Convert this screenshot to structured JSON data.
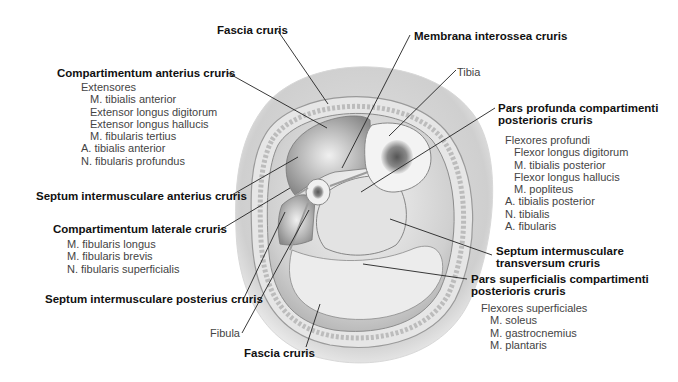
{
  "figure": {
    "labels": {
      "fascia_cruris_top": "Fascia cruris",
      "membrana_interossea": "Membrana interossea cruris",
      "tibia": "Tibia",
      "comp_anterius": "Compartimentum anterius cruris",
      "septum_anterius": "Septum intermusculare anterius cruris",
      "comp_laterale": "Compartimentum laterale cruris",
      "septum_posterius": "Septum intermusculare posterius cruris",
      "fibula": "Fibula",
      "fascia_cruris_bottom": "Fascia cruris",
      "pars_profunda_1": "Pars profunda compartimenti",
      "pars_profunda_2": "posterioris cruris",
      "septum_transversum_1": "Septum intermusculare",
      "septum_transversum_2": "transversum cruris",
      "pars_superficialis_1": "Pars superficialis compartimenti",
      "pars_superficialis_2": "posterioris cruris"
    },
    "anterior_contents": [
      {
        "text": "Extensores",
        "indent": 1
      },
      {
        "text": "M. tibialis anterior",
        "indent": 2
      },
      {
        "text": "Extensor longus digitorum",
        "indent": 2
      },
      {
        "text": "Extensor longus hallucis",
        "indent": 2
      },
      {
        "text": "M. fibularis tertius",
        "indent": 2
      },
      {
        "text": "A. tibialis anterior",
        "indent": 1
      },
      {
        "text": "N. fibularis profundus",
        "indent": 1
      }
    ],
    "lateral_contents": [
      {
        "text": "M. fibularis longus",
        "indent": 1
      },
      {
        "text": "M. fibularis brevis",
        "indent": 1
      },
      {
        "text": "N. fibularis superficialis",
        "indent": 1
      }
    ],
    "deep_posterior_contents": [
      {
        "text": "Flexores profundi",
        "indent": 1
      },
      {
        "text": "Flexor longus digitorum",
        "indent": 2
      },
      {
        "text": "M. tibialis posterior",
        "indent": 2
      },
      {
        "text": "Flexor longus hallucis",
        "indent": 2
      },
      {
        "text": "M. popliteus",
        "indent": 2
      },
      {
        "text": "A. tibialis posterior",
        "indent": 1
      },
      {
        "text": "N. tibialis",
        "indent": 1
      },
      {
        "text": "A. fibularis",
        "indent": 1
      }
    ],
    "superficial_posterior_contents": [
      {
        "text": "Flexores superficiales",
        "indent": 1
      },
      {
        "text": "M. soleus",
        "indent": 2
      },
      {
        "text": "M. gastrocnemius",
        "indent": 2
      },
      {
        "text": "M. plantaris",
        "indent": 2
      }
    ]
  }
}
